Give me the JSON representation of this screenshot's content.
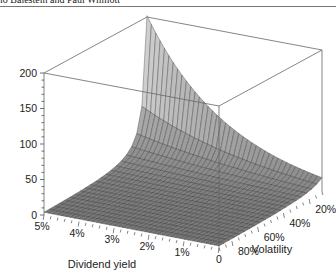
{
  "header": {
    "text": "lo Balestein and Paul Wilmott"
  },
  "colors": {
    "surface_low": "#6f6f6f",
    "surface_high": "#e6e6e6",
    "mesh": "#2e2e2e",
    "box": "#666666",
    "text": "#222222"
  },
  "chart_data": {
    "type": "surface3d",
    "title": "",
    "x_axis": {
      "label": "Dividend yield",
      "ticks": [
        "5%",
        "4%",
        "3%",
        "2%",
        "1%",
        "0"
      ],
      "range": [
        0.05,
        0
      ]
    },
    "y_axis": {
      "label": "Volatility",
      "ticks": [
        "80%",
        "60%",
        "40%",
        "20%"
      ],
      "range": [
        0.9,
        0.1
      ]
    },
    "z_axis": {
      "label": "",
      "ticks": [
        "0",
        "50",
        "100",
        "150",
        "200"
      ],
      "range": [
        0,
        200
      ],
      "minor_step": 10
    },
    "grid": {
      "dividend_steps": 40,
      "volatility_steps": 20
    },
    "surface_model": {
      "a": 2.73,
      "p": 0.87,
      "c": 0.046,
      "description": "z = a * exp(c * d_pct / v) / v^p"
    },
    "sample_points": [
      {
        "dividend": "0",
        "volatility": "90%",
        "value": 3
      },
      {
        "dividend": "0",
        "volatility": "10%",
        "value": 20
      },
      {
        "dividend": "5%",
        "volatility": "90%",
        "value": 4
      },
      {
        "dividend": "5%",
        "volatility": "10%",
        "value": 200
      }
    ]
  }
}
